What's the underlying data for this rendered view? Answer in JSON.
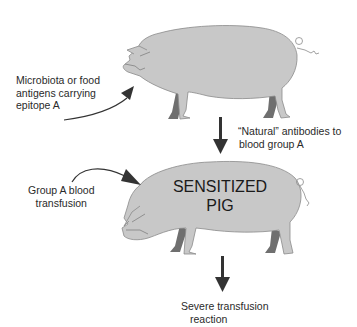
{
  "diagram": {
    "input_label_1": {
      "line1": "Microbiota or food",
      "line2": "antigens carrying",
      "line3": "epitope A"
    },
    "antibody_label": {
      "line1": "“Natural” antibodies to",
      "line2": "blood group A"
    },
    "input_label_2": {
      "line1": "Group A blood",
      "line2": "transfusion"
    },
    "sensitized_pig": {
      "line1": "SENSITIZED",
      "line2": "PIG"
    },
    "outcome_label": {
      "line1": "Severe transfusion",
      "line2": "reaction"
    },
    "colors": {
      "pig_body": "#c8c8c8",
      "pig_outline": "#8a8a8a",
      "pig_far_legs": "#6f6f6f",
      "arrow": "#333333"
    }
  }
}
